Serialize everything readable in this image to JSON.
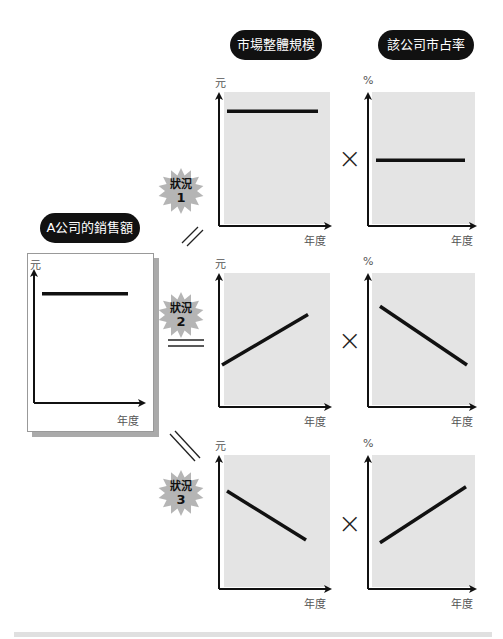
{
  "headers": {
    "market_size": "市場整體規模",
    "market_share": "該公司市占率",
    "company_sales": "A公司的銷售額"
  },
  "units": {
    "yuan": "元",
    "percent": "%",
    "year": "年度"
  },
  "operators": {
    "times": "×"
  },
  "scenarios": [
    {
      "label": "狀況",
      "number": "1",
      "relation": "parallel-slash",
      "market_size_trend": "flat",
      "market_share_trend": "flat"
    },
    {
      "label": "狀況",
      "number": "2",
      "relation": "equals",
      "market_size_trend": "rising",
      "market_share_trend": "falling"
    },
    {
      "label": "狀況",
      "number": "3",
      "relation": "backslash",
      "market_size_trend": "falling",
      "market_share_trend": "rising"
    }
  ],
  "chart_data": [
    {
      "type": "line",
      "title": "A公司的銷售額",
      "xlabel": "年度",
      "ylabel": "元",
      "x": [
        0,
        1
      ],
      "y": [
        0.78,
        0.78
      ],
      "ylim": [
        0,
        1
      ]
    },
    {
      "type": "line",
      "title": "市場整體規模 (狀況1)",
      "xlabel": "年度",
      "ylabel": "元",
      "x": [
        0,
        1
      ],
      "y": [
        0.82,
        0.82
      ],
      "ylim": [
        0,
        1
      ]
    },
    {
      "type": "line",
      "title": "該公司市占率 (狀況1)",
      "xlabel": "年度",
      "ylabel": "%",
      "x": [
        0,
        1
      ],
      "y": [
        0.47,
        0.47
      ],
      "ylim": [
        0,
        1
      ]
    },
    {
      "type": "line",
      "title": "市場整體規模 (狀況2)",
      "xlabel": "年度",
      "ylabel": "元",
      "x": [
        0,
        1
      ],
      "y": [
        0.3,
        0.66
      ],
      "ylim": [
        0,
        1
      ]
    },
    {
      "type": "line",
      "title": "該公司市占率 (狀況2)",
      "xlabel": "年度",
      "ylabel": "%",
      "x": [
        0,
        1
      ],
      "y": [
        0.72,
        0.3
      ],
      "ylim": [
        0,
        1
      ]
    },
    {
      "type": "line",
      "title": "市場整體規模 (狀況3)",
      "xlabel": "年度",
      "ylabel": "元",
      "x": [
        0,
        1
      ],
      "y": [
        0.7,
        0.35
      ],
      "ylim": [
        0,
        1
      ]
    },
    {
      "type": "line",
      "title": "該公司市占率 (狀況3)",
      "xlabel": "年度",
      "ylabel": "%",
      "x": [
        0,
        1
      ],
      "y": [
        0.33,
        0.73
      ],
      "ylim": [
        0,
        1
      ]
    }
  ]
}
